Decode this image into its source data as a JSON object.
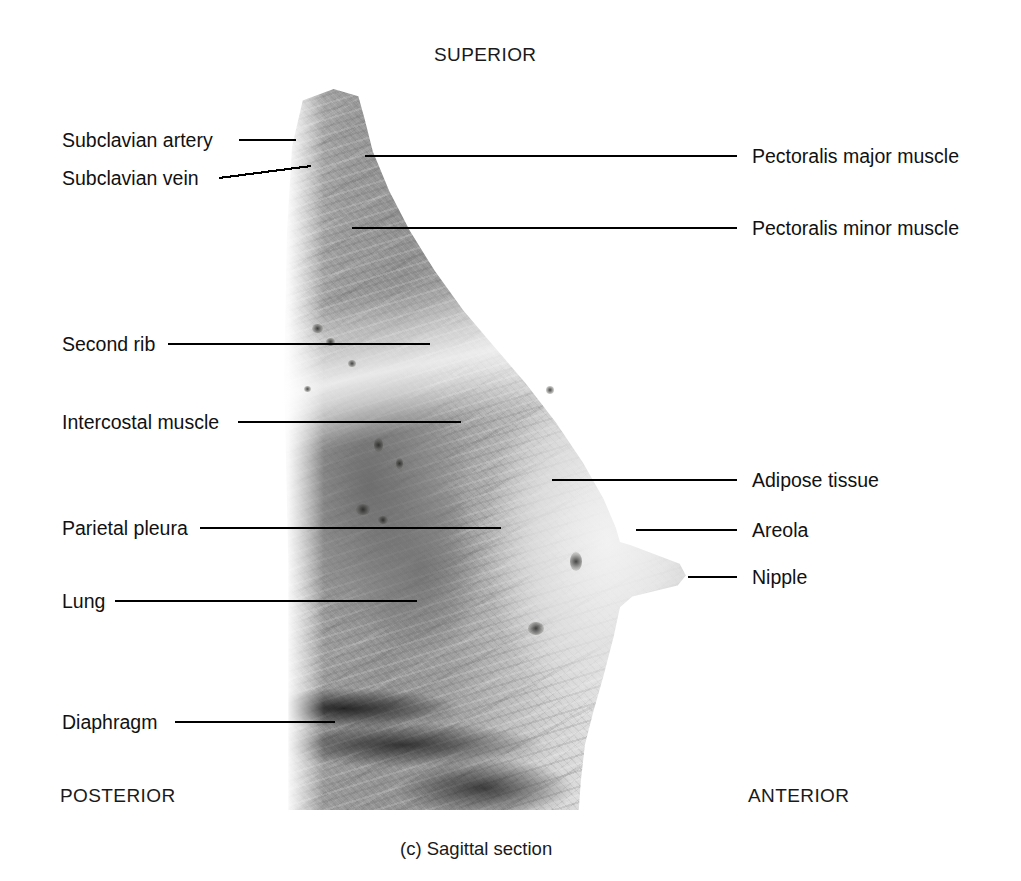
{
  "figure": {
    "caption": "(c) Sagittal section",
    "orientation": {
      "superior": "SUPERIOR",
      "posterior": "POSTERIOR",
      "anterior": "ANTERIOR"
    },
    "specimen_alt": "cadaveric sagittal section photograph of the breast and thoracic wall"
  },
  "labels_left": [
    {
      "id": "subclavian-artery",
      "text": "Subclavian artery"
    },
    {
      "id": "subclavian-vein",
      "text": "Subclavian vein"
    },
    {
      "id": "second-rib",
      "text": "Second rib"
    },
    {
      "id": "intercostal-muscle",
      "text": "Intercostal muscle"
    },
    {
      "id": "parietal-pleura",
      "text": "Parietal pleura"
    },
    {
      "id": "lung",
      "text": "Lung"
    },
    {
      "id": "diaphragm",
      "text": "Diaphragm"
    }
  ],
  "labels_right": [
    {
      "id": "pectoralis-major-muscle",
      "text": "Pectoralis major muscle"
    },
    {
      "id": "pectoralis-minor-muscle",
      "text": "Pectoralis minor muscle"
    },
    {
      "id": "adipose-tissue",
      "text": "Adipose tissue"
    },
    {
      "id": "areola",
      "text": "Areola"
    },
    {
      "id": "nipple",
      "text": "Nipple"
    }
  ],
  "colors": {
    "background": "#ffffff",
    "text": "#111111",
    "leader_line": "#000000",
    "specimen_mid_gray": "#a9a9a5"
  }
}
